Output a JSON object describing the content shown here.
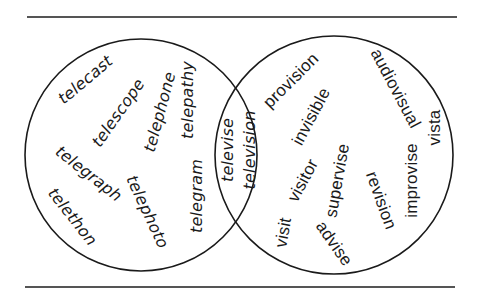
{
  "diagram": {
    "type": "venn",
    "colors": {
      "line": "#555555",
      "circle_stroke": "#1a1a1a",
      "text": "#1a1a1a",
      "background": "#ffffff"
    },
    "rules": {
      "top": {
        "x1": 27,
        "x2": 457,
        "y": 16
      },
      "bottom": {
        "x1": 25,
        "x2": 455,
        "y": 286
      }
    },
    "circles": {
      "left": {
        "cx": 141,
        "cy": 155,
        "r": 116
      },
      "right": {
        "cx": 334,
        "cy": 155,
        "r": 119
      }
    },
    "left_only": [
      {
        "text": "telecast",
        "x": 85,
        "y": 80,
        "rotate": -40
      },
      {
        "text": "telescope",
        "x": 118,
        "y": 113,
        "rotate": -55
      },
      {
        "text": "telephone",
        "x": 160,
        "y": 112,
        "rotate": -75
      },
      {
        "text": "telepathy",
        "x": 188,
        "y": 100,
        "rotate": -90
      },
      {
        "text": "telegraph",
        "x": 88,
        "y": 174,
        "rotate": 38
      },
      {
        "text": "telethon",
        "x": 72,
        "y": 217,
        "rotate": 52
      },
      {
        "text": "telephoto",
        "x": 147,
        "y": 212,
        "rotate": 65
      },
      {
        "text": "telegram",
        "x": 197,
        "y": 196,
        "rotate": -90
      }
    ],
    "intersection": [
      {
        "text": "televise",
        "x": 228,
        "y": 150,
        "rotate": -90
      },
      {
        "text": "television",
        "x": 249,
        "y": 150,
        "rotate": -90
      }
    ],
    "right_only": [
      {
        "text": "provision",
        "x": 291,
        "y": 80,
        "rotate": -45
      },
      {
        "text": "invisible",
        "x": 311,
        "y": 116,
        "rotate": -62
      },
      {
        "text": "audiovisual",
        "x": 395,
        "y": 88,
        "rotate": 62
      },
      {
        "text": "visitor",
        "x": 303,
        "y": 180,
        "rotate": -62
      },
      {
        "text": "supervise",
        "x": 337,
        "y": 180,
        "rotate": -80
      },
      {
        "text": "visit",
        "x": 283,
        "y": 232,
        "rotate": -80
      },
      {
        "text": "advise",
        "x": 334,
        "y": 243,
        "rotate": 55
      },
      {
        "text": "revision",
        "x": 381,
        "y": 200,
        "rotate": 70
      },
      {
        "text": "improvise",
        "x": 411,
        "y": 180,
        "rotate": -90
      },
      {
        "text": "vista",
        "x": 435,
        "y": 127,
        "rotate": -90
      }
    ]
  }
}
